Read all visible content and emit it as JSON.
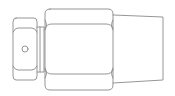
{
  "diagram": {
    "stroke_color": "#8a8a8a",
    "background": "#ffffff",
    "parts": [
      {
        "name": "small-hex-nut",
        "has_hole_marker": true
      },
      {
        "name": "collar"
      },
      {
        "name": "large-hex-body"
      },
      {
        "name": "tapered-tail"
      }
    ]
  }
}
